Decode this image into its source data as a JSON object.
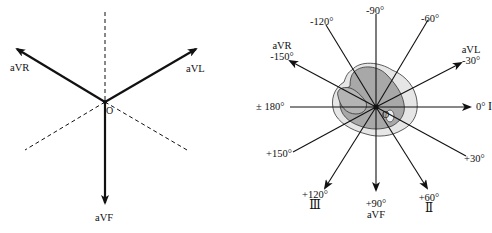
{
  "left_diagram": {
    "title": "Augmented limb lead axes",
    "center_label": "O",
    "leads": [
      {
        "name": "aVR"
      },
      {
        "name": "aVL"
      },
      {
        "name": "aVF"
      }
    ]
  },
  "right_diagram": {
    "title": "Hexaxial reference system",
    "center_label": "O",
    "axes": [
      {
        "angle": "0°",
        "lead": "I"
      },
      {
        "angle": "-30°",
        "lead": "aVL"
      },
      {
        "angle": "-60°",
        "lead": ""
      },
      {
        "angle": "-90°",
        "lead": ""
      },
      {
        "angle": "-120°",
        "lead": ""
      },
      {
        "angle": "-150°",
        "lead": "aVR"
      },
      {
        "angle": "± 180°",
        "lead": ""
      },
      {
        "angle": "+150°",
        "lead": ""
      },
      {
        "angle": "+120°",
        "lead": "Ⅲ"
      },
      {
        "angle": "+90°",
        "lead": "aVF"
      },
      {
        "angle": "+60°",
        "lead": "Ⅱ"
      },
      {
        "angle": "+30°",
        "lead": ""
      }
    ]
  },
  "colors": {
    "line": "#111111",
    "heart_outer": "#e6e6e6",
    "heart_inner": "#a8a8a8"
  }
}
